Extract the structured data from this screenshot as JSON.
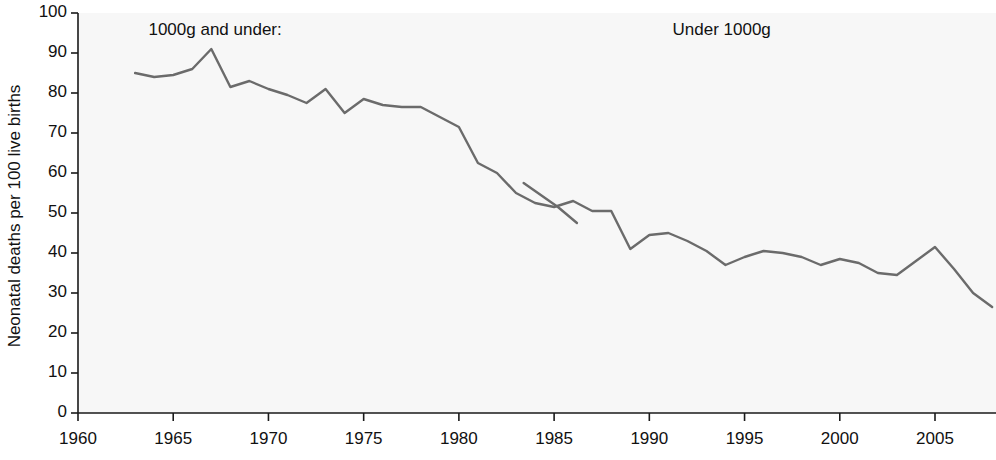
{
  "chart_data": {
    "type": "line",
    "title": "",
    "xlabel": "",
    "ylabel": "Neonatal deaths per 100 live births",
    "xlim": [
      1960,
      2008
    ],
    "ylim": [
      0,
      100
    ],
    "xticks": [
      1960,
      1965,
      1970,
      1975,
      1980,
      1985,
      1990,
      1995,
      2000,
      2005
    ],
    "xtick_labels": [
      "1960",
      "1965",
      "1970",
      "1975",
      "1980",
      "1985",
      "1990",
      "1995",
      "2000",
      "2005"
    ],
    "yticks": [
      0,
      10,
      20,
      30,
      40,
      50,
      60,
      70,
      80,
      90,
      100
    ],
    "ytick_labels": [
      "0",
      "10",
      "20",
      "30",
      "40",
      "50",
      "60",
      "70",
      "80",
      "90",
      "100"
    ],
    "grid": false,
    "legend": false,
    "line_color": "#6b6b6b",
    "background": "#f7f7f7",
    "axis_color": "#1a1a1a",
    "annotations": [
      {
        "text": "1000g and under:",
        "x": 1963.7,
        "y": 95.5,
        "align": "left"
      },
      {
        "text": "Under 1000g",
        "x": 1993.8,
        "y": 95.5,
        "align": "center"
      }
    ],
    "series": [
      {
        "name": "1000g and under",
        "x": [
          1963,
          1964,
          1965,
          1966,
          1967,
          1968,
          1969,
          1970,
          1971,
          1972,
          1973,
          1974,
          1975,
          1976,
          1977,
          1978,
          1979,
          1980,
          1981,
          1982,
          1983,
          1984,
          1985,
          1986,
          1987,
          1988,
          1989,
          1990,
          1991,
          1992,
          1993,
          1994,
          1995,
          1996,
          1997,
          1998,
          1999,
          2000,
          2001,
          2002,
          2003,
          2004,
          2005,
          2006,
          2007,
          2008
        ],
        "values": [
          85,
          84,
          84.5,
          86,
          91,
          81.5,
          83,
          81,
          79.5,
          77.5,
          81,
          75,
          78.5,
          77,
          76.5,
          76.5,
          74,
          71.5,
          62.5,
          60,
          55,
          52.5,
          51.5,
          53,
          50.5,
          50.5,
          41,
          44.5,
          45,
          43,
          40.5,
          37,
          39,
          40.5,
          40,
          39,
          37,
          38.5,
          37.5,
          35,
          34.5,
          38,
          41.5,
          36,
          30,
          26.5
        ]
      },
      {
        "name": "Under 1000g",
        "x": [
          1983.4,
          1984.6,
          1985.2,
          1986.2
        ],
        "values": [
          57.5,
          53.5,
          51.5,
          47.5
        ]
      }
    ]
  },
  "axis": {
    "y_axis_name": "y-axis",
    "x_axis_name": "x-axis"
  }
}
